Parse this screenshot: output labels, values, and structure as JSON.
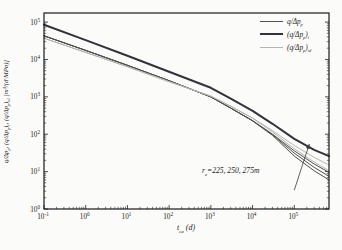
{
  "figure": {
    "xlabel": "t_{ca} (d)",
    "ylabel": "q/Δp_{p}, (q/Δp_{p})_{i}, (q/Δp_{p})_{id} [m³/(d·MPa)]"
  },
  "chart_data": {
    "type": "line",
    "xscale": "log",
    "yscale": "log",
    "xlabel": "t_ca (d)",
    "ylabel": "q/Δp_p, (q/Δp_p)_i, (q/Δp_p)_id [m³/(d·MPa)]",
    "xlim": [
      0.1,
      680000
    ],
    "ylim": [
      1,
      175000
    ],
    "x_tick_exponents": [
      -1,
      0,
      1,
      2,
      3,
      4,
      5
    ],
    "y_tick_exponents": [
      0,
      1,
      2,
      3,
      4,
      5
    ],
    "grid": false,
    "frame_color": "#1a1a1a",
    "legend_position": "upper right",
    "legend": [
      {
        "label": "q/Δp_{p}",
        "color": "#4f4f4f",
        "width": 1
      },
      {
        "label": "(q/Δp_{p})_{i}",
        "color": "#32323c",
        "width": 2
      },
      {
        "label": "(q/Δp_{p})_{id}",
        "color": "#b4b4b4",
        "width": 1
      }
    ],
    "series": [
      {
        "name": "rate-integral",
        "legend": "(q/Δp_p)_i",
        "color": "#32323c",
        "width": 2,
        "points": [
          [
            0.1,
            85000
          ],
          [
            1,
            33000
          ],
          [
            10,
            12500
          ],
          [
            100,
            4700
          ],
          [
            1000,
            1750
          ],
          [
            3000,
            900
          ],
          [
            10000,
            420
          ],
          [
            30000,
            190
          ],
          [
            100000,
            75
          ],
          [
            300000,
            38
          ],
          [
            680000,
            26
          ]
        ]
      },
      {
        "name": "rate-re275",
        "legend": "q/Δp_p",
        "color": "#4f4f4f",
        "width": 1,
        "points": [
          [
            0.1,
            43000
          ],
          [
            1,
            17500
          ],
          [
            10,
            7000
          ],
          [
            100,
            2700
          ],
          [
            1000,
            1000
          ],
          [
            3000,
            500
          ],
          [
            10000,
            230
          ],
          [
            30000,
            100
          ],
          [
            100000,
            36
          ],
          [
            300000,
            16
          ],
          [
            680000,
            9.5
          ]
        ]
      },
      {
        "name": "rate-re250",
        "legend": "q/Δp_p",
        "color": "#4f4f4f",
        "width": 1,
        "points": [
          [
            0.1,
            43000
          ],
          [
            1,
            17500
          ],
          [
            10,
            7000
          ],
          [
            100,
            2700
          ],
          [
            1000,
            1000
          ],
          [
            3000,
            500
          ],
          [
            10000,
            230
          ],
          [
            30000,
            97
          ],
          [
            100000,
            31
          ],
          [
            300000,
            13
          ],
          [
            680000,
            7.5
          ]
        ]
      },
      {
        "name": "rate-re225",
        "legend": "q/Δp_p",
        "color": "#4f4f4f",
        "width": 1,
        "points": [
          [
            0.1,
            43000
          ],
          [
            1,
            17500
          ],
          [
            10,
            7000
          ],
          [
            100,
            2700
          ],
          [
            1000,
            1000
          ],
          [
            3000,
            498
          ],
          [
            10000,
            228
          ],
          [
            30000,
            93
          ],
          [
            100000,
            26
          ],
          [
            300000,
            10.5
          ],
          [
            680000,
            6
          ]
        ]
      },
      {
        "name": "rate-integral-derivative-a",
        "legend": "(q/Δp_p)_id",
        "color": "#b4b4b4",
        "width": 1,
        "points": [
          [
            0.1,
            37000
          ],
          [
            1,
            15500
          ],
          [
            10,
            6400
          ],
          [
            100,
            2550
          ],
          [
            1000,
            1050
          ],
          [
            3000,
            560
          ],
          [
            10000,
            270
          ],
          [
            30000,
            125
          ],
          [
            100000,
            50
          ],
          [
            300000,
            24
          ],
          [
            680000,
            15
          ]
        ]
      },
      {
        "name": "rate-integral-derivative-b",
        "legend": "(q/Δp_p)_id",
        "color": "#b4b4b4",
        "width": 1,
        "points": [
          [
            0.1,
            37000
          ],
          [
            1,
            15500
          ],
          [
            10,
            6400
          ],
          [
            100,
            2550
          ],
          [
            1000,
            1050
          ],
          [
            3000,
            558
          ],
          [
            10000,
            268
          ],
          [
            30000,
            115
          ],
          [
            100000,
            41
          ],
          [
            300000,
            18
          ],
          [
            680000,
            10.5
          ]
        ]
      }
    ],
    "annotation": {
      "text": "r_{e}=225, 250, 275m",
      "arrow_from": [
        100000,
        3.2
      ],
      "arrow_to": [
        230000,
        55
      ],
      "arrow_color": "#3a3a3a"
    }
  }
}
